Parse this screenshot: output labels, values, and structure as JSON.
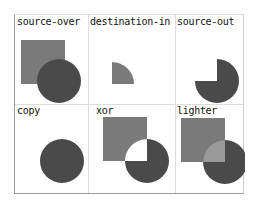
{
  "demo": {
    "title": "Canvas globalCompositeOperation examples",
    "colors": {
      "square": "#7a7a7a",
      "circle": "#4a4a4a",
      "lighter_overlap": "#9a9a9a",
      "background": "#ffffff"
    },
    "cells": [
      {
        "label": "source-over"
      },
      {
        "label": "destination-in"
      },
      {
        "label": "source-out"
      },
      {
        "label": "copy"
      },
      {
        "label": "xor"
      },
      {
        "label": "lighter"
      }
    ]
  }
}
